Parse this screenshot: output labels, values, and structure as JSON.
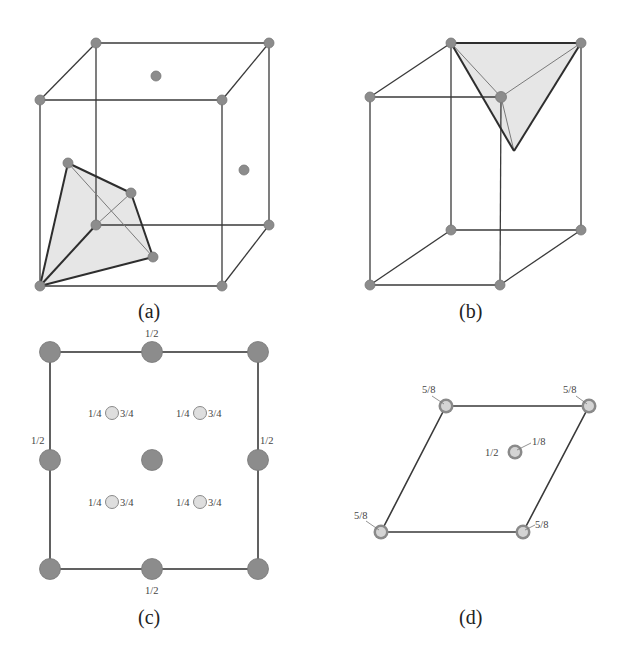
{
  "figure": {
    "panels": [
      {
        "id": "a",
        "caption": "(a)",
        "description": "Cubic (FCC) unit cell with shaded tetrahedral interstice at lower-left corner"
      },
      {
        "id": "b",
        "caption": "(b)",
        "description": "Tall prism (hexagonal-type) unit cell with shaded tetrahedron at the top face"
      },
      {
        "id": "c",
        "caption": "(c)",
        "description": "Square projection with heights",
        "labels": {
          "top_mid": "1/2",
          "bottom_mid": "1/2",
          "left_mid": "1/2",
          "right_mid": "1/2",
          "inner": [
            {
              "left": "1/4",
              "right": "3/4"
            },
            {
              "left": "1/4",
              "right": "3/4"
            },
            {
              "left": "1/4",
              "right": "3/4"
            },
            {
              "left": "1/4",
              "right": "3/4"
            }
          ]
        }
      },
      {
        "id": "d",
        "caption": "(d)",
        "description": "Rhombic (hexagonal) projection with heights",
        "labels": {
          "top_left": "5/8",
          "top_right": "5/8",
          "bottom_left": "5/8",
          "bottom_right": "5/8",
          "center_left": "1/2",
          "center_right": "1/8"
        }
      }
    ],
    "colors": {
      "atom": "#8c8c8c",
      "atom_light": "#dedede",
      "face_shade": "#e6e6e6",
      "line": "#3a3a3a"
    }
  }
}
